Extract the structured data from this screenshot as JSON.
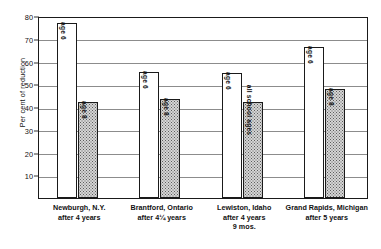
{
  "chart_data": {
    "type": "bar",
    "title": "",
    "subtitle": "",
    "xlabel": "",
    "ylabel": "Per cent of reduction",
    "ylim": [
      0,
      80
    ],
    "ytick_step": 10,
    "yticks": [
      10,
      20,
      30,
      40,
      50,
      60,
      70,
      80
    ],
    "grid": true,
    "legend": "none",
    "categories": [
      "Newburgh, N.Y. after 4 years",
      "Brantford, Ontario after 4¼ years",
      "Lewiston, Idaho after 4 years 9 mos.",
      "Grand Rapids, Michigan after 5 years"
    ],
    "category_lines": [
      [
        "Newburgh, N.Y.",
        "after 4 years"
      ],
      [
        "Brantford, Ontario",
        "after 4¼ years"
      ],
      [
        "Lewiston, Idaho",
        "after 4 years",
        "9 mos."
      ],
      [
        "Grand Rapids, Michigan",
        "after 5 years"
      ]
    ],
    "bars": [
      {
        "group": 0,
        "label": "age 6",
        "value": 77,
        "style": "light"
      },
      {
        "group": 0,
        "label": "age 8",
        "value": 42,
        "style": "hatch"
      },
      {
        "group": 1,
        "label": "age 6",
        "value": 55.5,
        "style": "light"
      },
      {
        "group": 1,
        "label": "age 8",
        "value": 43.5,
        "style": "hatch"
      },
      {
        "group": 2,
        "label": "age 6",
        "value": 55,
        "style": "light"
      },
      {
        "group": 2,
        "label": "all school ages",
        "value": 42,
        "style": "hatch"
      },
      {
        "group": 3,
        "label": "age 6",
        "value": 66.5,
        "style": "light"
      },
      {
        "group": 3,
        "label": "age 8",
        "value": 48,
        "style": "hatch"
      }
    ],
    "series": [
      {
        "name": "age 6",
        "values": [
          77,
          55.5,
          55,
          66.5
        ]
      },
      {
        "name": "age 8 / all school ages",
        "values": [
          42,
          43.5,
          42,
          48
        ]
      }
    ],
    "colors": {
      "bar_light": "#ffffff",
      "bar_hatch": "#d5d5d5",
      "outline": "#1a1a1a",
      "gridline": "#8c8c8c",
      "text": "#111111"
    }
  }
}
